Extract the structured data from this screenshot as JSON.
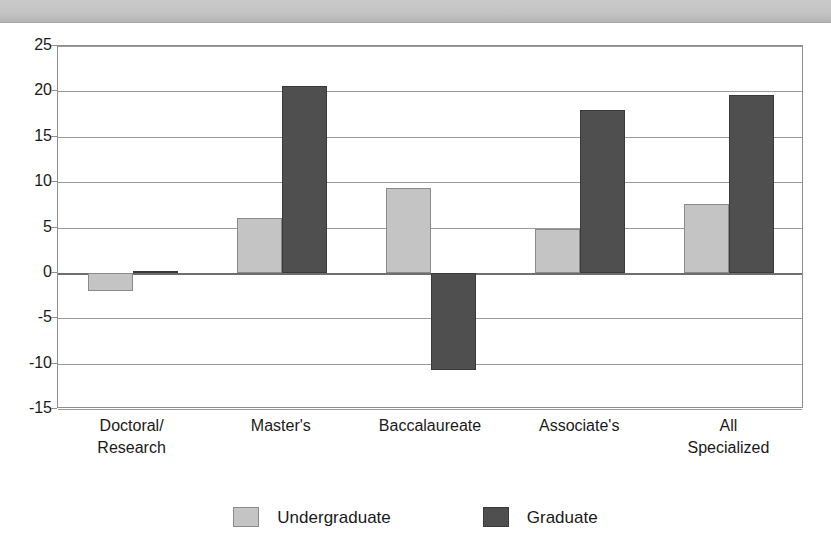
{
  "top_band": {
    "label": "decorative-header-band"
  },
  "legend": {
    "position": "bottom-center",
    "entries": [
      {
        "label": "Undergraduate",
        "color": "#c4c4c4"
      },
      {
        "label": "Graduate",
        "color": "#4f4f4f"
      }
    ]
  },
  "axis": {
    "y_ticks": [
      "25",
      "20",
      "15",
      "10",
      "5",
      "0",
      "-5",
      "-10",
      "-15"
    ]
  },
  "chart_data": {
    "type": "bar",
    "title": "",
    "subtitle": "",
    "xlabel": "",
    "ylabel": "",
    "ylim": [
      -15,
      25
    ],
    "yticks": [
      -15,
      -10,
      -5,
      0,
      5,
      10,
      15,
      20,
      25
    ],
    "grid": true,
    "legend_position": "bottom-center",
    "categories": [
      "Doctoral/\nResearch",
      "Master's",
      "Baccalaureate",
      "Associate's",
      "All\nSpecialized"
    ],
    "series": [
      {
        "name": "Undergraduate",
        "color": "#c4c4c4",
        "values": [
          -2.0,
          6.0,
          9.3,
          4.8,
          7.6
        ]
      },
      {
        "name": "Graduate",
        "color": "#4f4f4f",
        "values": [
          0.1,
          20.6,
          -10.7,
          17.9,
          19.6
        ]
      }
    ]
  }
}
